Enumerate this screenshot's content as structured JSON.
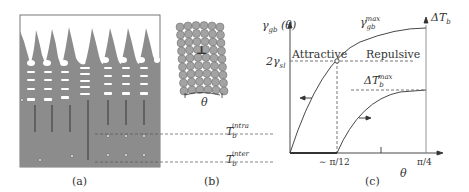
{
  "panels": {
    "a": {
      "caption": "(a)",
      "description": "dendritic solidification microstructure"
    },
    "b": {
      "caption": "(b)",
      "theta_label": "θ",
      "dislocation_symbol": "⊥",
      "levels": {
        "intra": {
          "base": "T",
          "sub": "b",
          "sup": "intra"
        },
        "inter": {
          "base": "T",
          "sub": "b",
          "sup": "inter"
        }
      }
    },
    "c": {
      "caption": "(c)",
      "y_left_label": {
        "base": "γ",
        "sub": "gb",
        "suffix": "(θ)"
      },
      "y_right_label": {
        "base": "ΔT",
        "sub": "b"
      },
      "level_label": {
        "prefix": "2γ",
        "sub": "sl"
      },
      "curve_gamma_label": {
        "base": "γ",
        "sub": "gb",
        "sup": "max"
      },
      "curve_dT_label": {
        "base": "ΔT",
        "sub": "b",
        "sup": "max"
      },
      "region_attractive": "Attractive",
      "region_repulsive": "Repulsive",
      "x_tick_1": "∼ π/12",
      "x_tick_2": "π/4",
      "x_label": "θ"
    }
  },
  "colors": {
    "solid_gray": "#8c8c8c",
    "circle_fill": "#a3a3a3",
    "line": "#333333"
  }
}
